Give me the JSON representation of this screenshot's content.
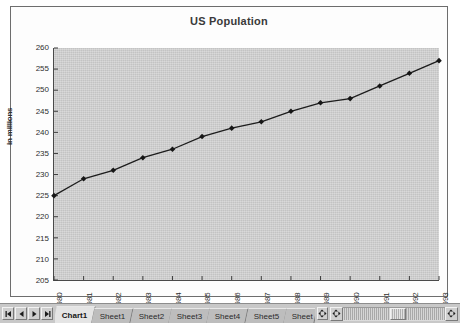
{
  "chart_data": {
    "type": "line",
    "title": "US Population",
    "xlabel": "",
    "ylabel": "in millions",
    "ylim": [
      205,
      260
    ],
    "ytick_step": 5,
    "yticks": [
      260,
      255,
      250,
      245,
      240,
      235,
      230,
      225,
      220,
      215,
      210,
      205
    ],
    "categories": [
      "1980",
      "1981",
      "1982",
      "1983",
      "1984",
      "1985",
      "1986",
      "1987",
      "1988",
      "1989",
      "1990",
      "1991",
      "1992",
      "1993"
    ],
    "values": [
      225,
      229,
      231,
      234,
      236,
      239,
      241,
      242.5,
      245,
      247,
      248,
      251,
      254,
      257
    ],
    "series": [
      {
        "name": "US Population",
        "values": [
          225,
          229,
          231,
          234,
          236,
          239,
          241,
          242.5,
          245,
          247,
          248,
          251,
          254,
          257
        ]
      }
    ],
    "grid": false,
    "legend": "none",
    "marker": "diamond",
    "line_color": "#1c1c1c",
    "marker_color": "#161616",
    "plot_background": "#c3c3c3"
  },
  "tab_bar": {
    "nav_buttons": [
      {
        "name": "first-sheet-button",
        "icon": "first-arrow-icon"
      },
      {
        "name": "previous-sheet-button",
        "icon": "previous-arrow-icon"
      },
      {
        "name": "next-sheet-button",
        "icon": "next-arrow-icon"
      },
      {
        "name": "last-sheet-button",
        "icon": "last-arrow-icon"
      }
    ],
    "tabs": [
      {
        "label": "Chart1",
        "active": true
      },
      {
        "label": "Sheet1",
        "active": false
      },
      {
        "label": "Sheet2",
        "active": false
      },
      {
        "label": "Sheet3",
        "active": false
      },
      {
        "label": "Sheet4",
        "active": false
      },
      {
        "label": "Sheet5",
        "active": false
      },
      {
        "label": "Sheet",
        "active": false
      }
    ],
    "splitter_icon": "tab-splitter-icon",
    "scroll_left_icon": "scroll-left-arrow-icon",
    "scroll_right_icon": "scroll-right-arrow-icon"
  }
}
